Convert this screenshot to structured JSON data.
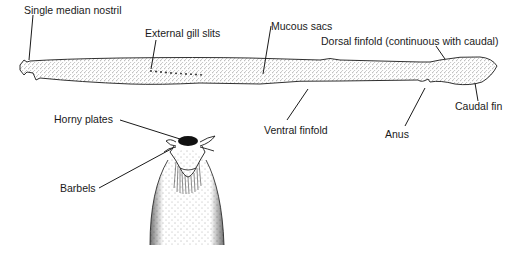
{
  "figure": {
    "labels": {
      "nostril": "Single median nostril",
      "gill_slits": "External gill slits",
      "mucous_sacs": "Mucous sacs",
      "dorsal_finfold": "Dorsal finfold (continuous with caudal)",
      "caudal_fin": "Caudal fin",
      "ventral_finfold": "Ventral finfold",
      "anus": "Anus",
      "horny_plates": "Horny plates",
      "barbels": "Barbels"
    },
    "views": {
      "lateral": "Lateral view of whole body",
      "ventral_head": "Ventral view of head"
    },
    "colors": {
      "ink": "#1a1a1a",
      "background": "#ffffff",
      "stipple": "#555555"
    }
  }
}
